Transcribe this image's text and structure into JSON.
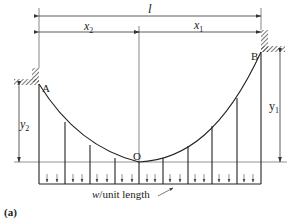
{
  "figure": {
    "caption": "(a)",
    "labels": {
      "span": "l",
      "x2": "x",
      "x2_sub": "2",
      "x1": "x",
      "x1_sub": "1",
      "y2": "y",
      "y2_sub": "2",
      "y1": "y",
      "y1_sub": "1",
      "point_a": "A",
      "point_b": "B",
      "point_o": "O",
      "load_w": "w",
      "load_text": "/unit length"
    },
    "colors": {
      "line": "#2a2a2a",
      "thin": "#555555",
      "background": "#ffffff"
    }
  }
}
